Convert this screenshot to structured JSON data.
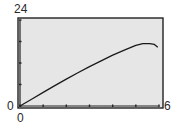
{
  "chart_data": {
    "type": "line",
    "title": "",
    "xlabel": "",
    "ylabel": "",
    "xlim": [
      0,
      6
    ],
    "ylim": [
      0,
      24
    ],
    "x_tick_step": 1,
    "y_tick_step": 6,
    "grid": false,
    "legend": null,
    "labels": {
      "y_max": "24",
      "y_min": "0",
      "x_min": "0",
      "x_max": "6"
    },
    "series": [
      {
        "name": "curve",
        "x": [
          0,
          0.5,
          1,
          1.5,
          2,
          2.5,
          3,
          3.5,
          4,
          4.5,
          5,
          5.3,
          5.6,
          5.8,
          5.95
        ],
        "y": [
          0,
          1.9,
          3.8,
          5.7,
          7.5,
          9.3,
          11.0,
          12.6,
          14.2,
          15.6,
          16.9,
          17.4,
          17.4,
          17.2,
          16.4
        ]
      }
    ]
  },
  "colors": {
    "plot_bg": "#e6e6e6",
    "frame": "#222222",
    "curve": "#1a1a1a"
  }
}
